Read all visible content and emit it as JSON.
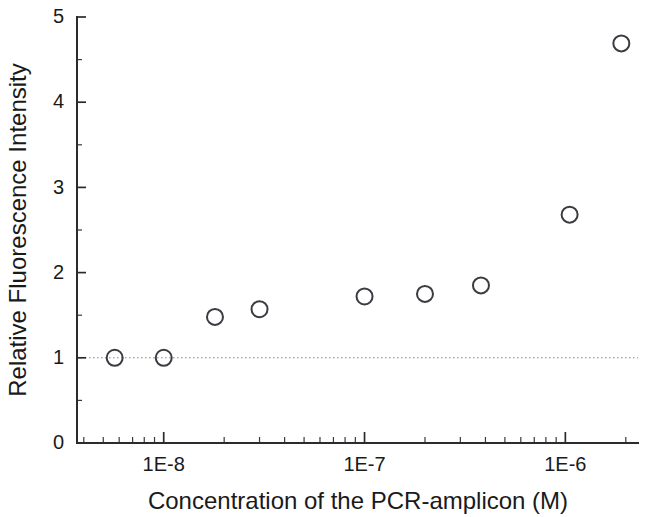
{
  "chart_data": {
    "type": "scatter",
    "title": "",
    "xlabel": "Concentration of the PCR-amplicon (M)",
    "ylabel": "Relative Fluorescence Intensity",
    "xscale": "log",
    "yscale": "linear",
    "xlim": [
      3.7e-09,
      2.3e-06
    ],
    "ylim": [
      0,
      5
    ],
    "grid": false,
    "legend": null,
    "marker_style": "open-circle",
    "marker_color": "#3b3b42",
    "reference_lines": [
      {
        "axis": "y",
        "value": 1,
        "style": "dotted",
        "color": "#8c8c8c"
      }
    ],
    "x": [
      5.7e-09,
      1e-08,
      1.8e-08,
      3e-08,
      1e-07,
      2e-07,
      3.8e-07,
      1.05e-06,
      1.9e-06
    ],
    "y": [
      1.0,
      1.0,
      1.48,
      1.57,
      1.72,
      1.75,
      1.85,
      2.68,
      4.69
    ],
    "points": [
      {
        "x": 5.7e-09,
        "y": 1.0
      },
      {
        "x": 1e-08,
        "y": 1.0
      },
      {
        "x": 1.8e-08,
        "y": 1.48
      },
      {
        "x": 3e-08,
        "y": 1.57
      },
      {
        "x": 1e-07,
        "y": 1.72
      },
      {
        "x": 2e-07,
        "y": 1.75
      },
      {
        "x": 3.8e-07,
        "y": 1.85
      },
      {
        "x": 1.05e-06,
        "y": 2.68
      },
      {
        "x": 1.9e-06,
        "y": 4.69
      }
    ],
    "yticks": [
      0,
      1,
      2,
      3,
      4,
      5
    ],
    "ytick_labels": [
      "0",
      "1",
      "2",
      "3",
      "4",
      "5"
    ],
    "yticks_minor": [
      0.5,
      1.5,
      2.5,
      3.5,
      4.5
    ],
    "xticks": [
      1e-08,
      1e-07,
      1e-06
    ],
    "xtick_labels": [
      "1E-8",
      "1E-7",
      "1E-6"
    ]
  },
  "axes": {
    "x_title": "Concentration of the PCR-amplicon (M)",
    "y_title": "Relative Fluorescence Intensity"
  }
}
